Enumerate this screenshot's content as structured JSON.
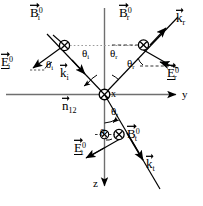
{
  "figure": {
    "background_color": "#ffffff",
    "stroke_color": "#000000",
    "axis_color": "#6b6b6b",
    "dashed_color": "#555555",
    "width": 203,
    "height": 206
  },
  "axes": {
    "y_label": "y",
    "z_label": "z",
    "x_label": "x",
    "origin_marker": "circled-x"
  },
  "normal": {
    "symbol": "n",
    "subscript": "12",
    "superscript": ""
  },
  "angles": {
    "theta_i_upper": {
      "symbol": "θ",
      "sub": "i"
    },
    "theta_r_upper": {
      "symbol": "θ",
      "sub": "r"
    },
    "theta_i_left": {
      "symbol": "θ",
      "sub": "i"
    },
    "theta_r_right": {
      "symbol": "θ",
      "sub": "r"
    },
    "theta_t_upper": {
      "symbol": "θ",
      "sub": "t"
    },
    "theta_t_lower": {
      "symbol": "θ",
      "sub": "t"
    }
  },
  "vectors": {
    "k_i": {
      "symbol": "k",
      "sub": "i",
      "sup": "",
      "arrow": true,
      "underline": false
    },
    "k_r": {
      "symbol": "k",
      "sub": "r",
      "sup": "",
      "arrow": true,
      "underline": false
    },
    "k_t": {
      "symbol": "k",
      "sub": "t",
      "sup": "",
      "arrow": true,
      "underline": false
    },
    "E_i0": {
      "symbol": "E",
      "sub": "i",
      "sup": "0",
      "arrow": true,
      "underline": true
    },
    "E_r0": {
      "symbol": "E",
      "sub": "r",
      "sup": "0",
      "arrow": true,
      "underline": true
    },
    "E_t0": {
      "symbol": "E",
      "sub": "t",
      "sup": "0",
      "arrow": true,
      "underline": true
    },
    "B_i0": {
      "symbol": "B",
      "sub": "i",
      "sup": "0",
      "arrow": true,
      "underline": false
    },
    "B_r0": {
      "symbol": "B",
      "sub": "r",
      "sup": "0",
      "arrow": true,
      "underline": false
    },
    "B_t0": {
      "symbol": "B",
      "sub": "t",
      "sup": "0",
      "arrow": true,
      "underline": false
    }
  },
  "markers": {
    "B_i_into_page": "circled-x",
    "B_r_into_page": "circled-x",
    "B_t_into_page": "circled-x",
    "origin_into_page": "circled-x",
    "E_t_origin_into_page": "circled-x"
  }
}
